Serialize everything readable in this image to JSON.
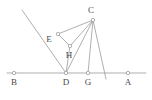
{
  "figure": {
    "type": "geometry-diagram",
    "width": 152,
    "height": 100,
    "background_color": "#ffffff",
    "stroke_color": "#9a9a9a",
    "label_color": "#4a4a4a",
    "marker_fill": "#ffffff",
    "stroke_width": 0.8,
    "marker_radius": 1.7,
    "points": [
      {
        "id": "B",
        "label": "B",
        "x": 14,
        "y": 73,
        "label_x": 14,
        "label_y": 85,
        "marker": "open-circle"
      },
      {
        "id": "D",
        "label": "D",
        "x": 66,
        "y": 73,
        "label_x": 66,
        "label_y": 85,
        "marker": "open-circle"
      },
      {
        "id": "G",
        "label": "G",
        "x": 88,
        "y": 73,
        "label_x": 88,
        "label_y": 85,
        "marker": "open-circle"
      },
      {
        "id": "A",
        "label": "A",
        "x": 128,
        "y": 73,
        "label_x": 128,
        "label_y": 85,
        "marker": "open-circle"
      },
      {
        "id": "C",
        "label": "C",
        "x": 93,
        "y": 20,
        "label_x": 91,
        "label_y": 13,
        "marker": "open-circle"
      },
      {
        "id": "E",
        "label": "E",
        "x": 58,
        "y": 34,
        "label_x": 49,
        "label_y": 42,
        "marker": "open-circle"
      },
      {
        "id": "H",
        "label": "H",
        "x": 70,
        "y": 46,
        "label_x": 69,
        "label_y": 58,
        "marker": "open-circle"
      }
    ],
    "segments": [
      {
        "id": "baseline",
        "name": "baseline-B-A",
        "x1": 7,
        "y1": 73,
        "x2": 146,
        "y2": 73
      },
      {
        "id": "ray-through-E",
        "name": "ray-through-E-to-D",
        "x1": 22,
        "y1": 10,
        "x2": 66,
        "y2": 73
      },
      {
        "id": "E-C",
        "name": "segment-E-C",
        "x1": 58,
        "y1": 34,
        "x2": 93,
        "y2": 20
      },
      {
        "id": "E-H",
        "name": "segment-E-H",
        "x1": 58,
        "y1": 34,
        "x2": 70,
        "y2": 46
      },
      {
        "id": "H-C",
        "name": "segment-H-C",
        "x1": 70,
        "y1": 46,
        "x2": 93,
        "y2": 20
      },
      {
        "id": "H-D",
        "name": "segment-H-D",
        "x1": 70,
        "y1": 46,
        "x2": 66,
        "y2": 73
      },
      {
        "id": "D-C",
        "name": "segment-D-C",
        "x1": 66,
        "y1": 73,
        "x2": 93,
        "y2": 20
      },
      {
        "id": "C-G",
        "name": "segment-C-G",
        "x1": 93,
        "y1": 20,
        "x2": 88,
        "y2": 73
      },
      {
        "id": "C-through-G-extended",
        "name": "cevian-C-through-baseline-extended",
        "x1": 93,
        "y1": 20,
        "x2": 106,
        "y2": 79
      }
    ],
    "labels_order": [
      "B",
      "D",
      "G",
      "A",
      "C",
      "E",
      "H"
    ]
  }
}
